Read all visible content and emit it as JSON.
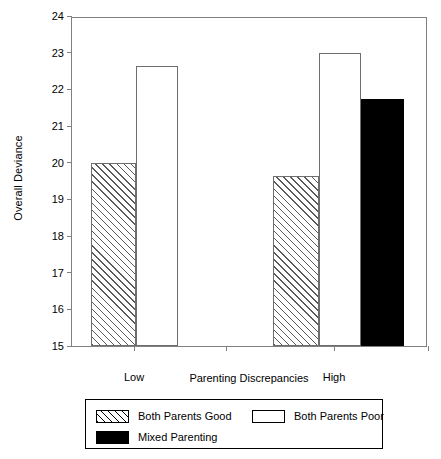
{
  "chart_data": {
    "type": "bar",
    "title": "",
    "xlabel": "Parenting Discrepancies",
    "ylabel": "Overall Deviance",
    "categories": [
      "Low",
      "High"
    ],
    "ylim": [
      15,
      24
    ],
    "yticks": [
      15,
      16,
      17,
      18,
      19,
      20,
      21,
      22,
      23,
      24
    ],
    "ytick_labels": [
      "15",
      "16",
      "17",
      "18",
      "19",
      "20",
      "21",
      "22",
      "23",
      "24"
    ],
    "grid": false,
    "legend_position": "bottom",
    "series": [
      {
        "name": "Both Parents Good",
        "fill": "hatch",
        "values": [
          20.0,
          19.65
        ]
      },
      {
        "name": "Both Parents Poor",
        "fill": "open",
        "values": [
          22.65,
          23.0
        ]
      },
      {
        "name": "Mixed Parenting",
        "fill": "solid",
        "values": [
          null,
          21.75
        ]
      }
    ],
    "bars": [
      {
        "group": "Low",
        "series": "Both Parents Good",
        "value": 20.0,
        "fill": "hatch",
        "x": 19,
        "width": 45
      },
      {
        "group": "Low",
        "series": "Both Parents Poor",
        "value": 22.65,
        "fill": "open",
        "x": 64,
        "width": 42
      },
      {
        "group": "High",
        "series": "Both Parents Good",
        "value": 19.65,
        "fill": "hatch",
        "x": 201,
        "width": 46
      },
      {
        "group": "High",
        "series": "Both Parents Poor",
        "value": 23.0,
        "fill": "open",
        "x": 247,
        "width": 42
      },
      {
        "group": "High",
        "series": "Mixed Parenting",
        "value": 21.75,
        "fill": "solid",
        "x": 289,
        "width": 43
      }
    ],
    "xticks": [
      {
        "label": "Low",
        "x": 62
      },
      {
        "label": "",
        "x": 154
      },
      {
        "label": "High",
        "x": 262
      },
      {
        "label": "",
        "x": 356
      }
    ],
    "colors": {
      "axis": "#808080",
      "bar_outline": "#6e6e6e",
      "solid_fill": "#000000",
      "hatch": "#5a5a5a",
      "background": "#ffffff",
      "text": "#000000"
    }
  },
  "legend": {
    "entries": [
      {
        "label": "Both Parents Good",
        "fill": "hatch",
        "row": 0,
        "col": 0
      },
      {
        "label": "Both Parents Poor",
        "fill": "open",
        "row": 0,
        "col": 1
      },
      {
        "label": "Mixed Parenting",
        "fill": "solid",
        "row": 1,
        "col": 0
      }
    ]
  }
}
